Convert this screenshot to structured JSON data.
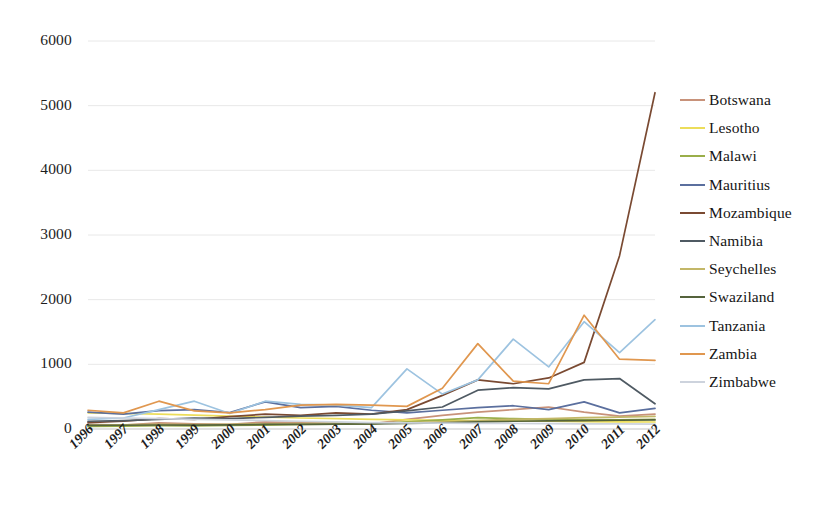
{
  "chart_data": {
    "type": "line",
    "title": "",
    "xlabel": "",
    "ylabel": "",
    "grid": true,
    "legend_position": "right",
    "ylim": [
      0,
      6000
    ],
    "ytick_labels": [
      "6000",
      "5000",
      "4000",
      "3000",
      "2000",
      "1000",
      "0"
    ],
    "ytick_values": [
      6000,
      5000,
      4000,
      3000,
      2000,
      1000,
      0
    ],
    "categories": [
      "1996",
      "1997",
      "1998",
      "1999",
      "2000",
      "2001",
      "2002",
      "2003",
      "2004",
      "2005",
      "2006",
      "2007",
      "2008",
      "2009",
      "2010",
      "2011",
      "2012"
    ],
    "x": [
      1996,
      1997,
      1998,
      1999,
      2000,
      2001,
      2002,
      2003,
      2004,
      2005,
      2006,
      2007,
      2008,
      2009,
      2010,
      2011,
      2012
    ],
    "series": [
      {
        "name": "Botswana",
        "color": "#c8927a",
        "values": [
          70,
          60,
          95,
          80,
          70,
          110,
          100,
          90,
          80,
          150,
          210,
          260,
          300,
          340,
          260,
          200,
          230
        ]
      },
      {
        "name": "Lesotho",
        "color": "#ecdd5a",
        "values": [
          250,
          240,
          230,
          215,
          200,
          185,
          170,
          160,
          150,
          140,
          135,
          130,
          125,
          120,
          115,
          110,
          108
        ]
      },
      {
        "name": "Malawi",
        "color": "#9aae4a",
        "values": [
          40,
          45,
          50,
          48,
          55,
          60,
          70,
          75,
          80,
          110,
          140,
          175,
          160,
          150,
          145,
          140,
          150
        ]
      },
      {
        "name": "Mauritius",
        "color": "#5b6f9e",
        "values": [
          260,
          230,
          285,
          300,
          255,
          420,
          330,
          350,
          290,
          250,
          290,
          330,
          360,
          300,
          420,
          250,
          320
        ]
      },
      {
        "name": "Mozambique",
        "color": "#7a4a32",
        "values": [
          100,
          120,
          160,
          150,
          190,
          230,
          210,
          250,
          230,
          300,
          520,
          760,
          700,
          790,
          1030,
          2680,
          5200
        ]
      },
      {
        "name": "Namibia",
        "color": "#4f5a63",
        "values": [
          120,
          130,
          150,
          170,
          160,
          180,
          200,
          210,
          230,
          280,
          340,
          600,
          640,
          620,
          760,
          780,
          390
        ]
      },
      {
        "name": "Seychelles",
        "color": "#c3b768",
        "values": [
          60,
          65,
          70,
          68,
          72,
          80,
          85,
          90,
          95,
          100,
          110,
          130,
          150,
          160,
          175,
          185,
          195
        ]
      },
      {
        "name": "Swaziland",
        "color": "#55633c",
        "values": [
          55,
          58,
          62,
          60,
          65,
          70,
          72,
          75,
          78,
          85,
          95,
          110,
          120,
          125,
          130,
          135,
          140
        ]
      },
      {
        "name": "Tanzania",
        "color": "#9dc3e0",
        "values": [
          150,
          170,
          300,
          430,
          240,
          430,
          380,
          370,
          330,
          930,
          540,
          760,
          1390,
          960,
          1660,
          1180,
          1690
        ]
      },
      {
        "name": "Zambia",
        "color": "#e0974f",
        "values": [
          290,
          250,
          430,
          280,
          250,
          300,
          370,
          380,
          370,
          350,
          630,
          1320,
          740,
          700,
          1760,
          1080,
          1060
        ]
      },
      {
        "name": "Zimbabwe",
        "color": "#cdd3dd",
        "values": [
          180,
          170,
          160,
          150,
          140,
          130,
          120,
          110,
          100,
          95,
          90,
          88,
          85,
          82,
          80,
          78,
          76
        ]
      }
    ]
  },
  "legend": {
    "items": [
      {
        "label": "Botswana"
      },
      {
        "label": "Lesotho"
      },
      {
        "label": "Malawi"
      },
      {
        "label": "Mauritius"
      },
      {
        "label": "Mozambique"
      },
      {
        "label": "Namibia"
      },
      {
        "label": "Seychelles"
      },
      {
        "label": "Swaziland"
      },
      {
        "label": "Tanzania"
      },
      {
        "label": "Zambia"
      },
      {
        "label": "Zimbabwe"
      }
    ]
  }
}
